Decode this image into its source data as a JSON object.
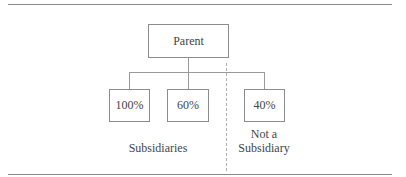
{
  "diagram": {
    "parent": {
      "label": "Parent"
    },
    "children": [
      {
        "label": "100%"
      },
      {
        "label": "60%"
      },
      {
        "label": "40%"
      }
    ],
    "groups": {
      "subsidiaries": "Subsidiaries",
      "not_subsidiary_line1": "Not a",
      "not_subsidiary_line2": "Subsidiary"
    }
  }
}
